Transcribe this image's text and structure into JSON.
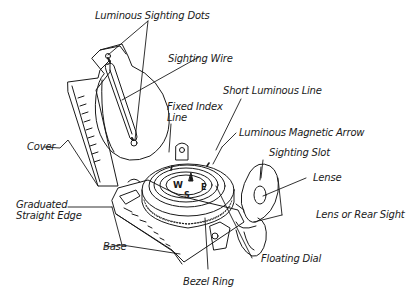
{
  "diagram": {
    "colors": {
      "line": "#1a1a1a",
      "background": "#ffffff"
    },
    "labels": [
      {
        "id": "luminous-sighting-dots",
        "text": "Luminous Sighting Dots"
      },
      {
        "id": "sighting-wire",
        "text": "Sighting Wire"
      },
      {
        "id": "short-luminous-line",
        "text": "Short Luminous Line"
      },
      {
        "id": "fixed-index-line-1",
        "text": "Fixed Index"
      },
      {
        "id": "fixed-index-line-2",
        "text": "Line"
      },
      {
        "id": "luminous-magnetic-arrow",
        "text": "Luminous Magnetic Arrow"
      },
      {
        "id": "sighting-slot",
        "text": "Sighting Slot"
      },
      {
        "id": "cover",
        "text": "Cover"
      },
      {
        "id": "lense",
        "text": "Lense"
      },
      {
        "id": "graduated-straight-edge-1",
        "text": "Graduated"
      },
      {
        "id": "graduated-straight-edge-2",
        "text": "Straight Edge"
      },
      {
        "id": "lens-or-rear-sight",
        "text": "Lens or Rear Sight"
      },
      {
        "id": "base",
        "text": "Base"
      },
      {
        "id": "floating-dial",
        "text": "Floating Dial"
      },
      {
        "id": "bezel-ring",
        "text": "Bezel Ring"
      }
    ],
    "dial_letters": {
      "west": "W",
      "east": "E",
      "south": "S"
    }
  }
}
